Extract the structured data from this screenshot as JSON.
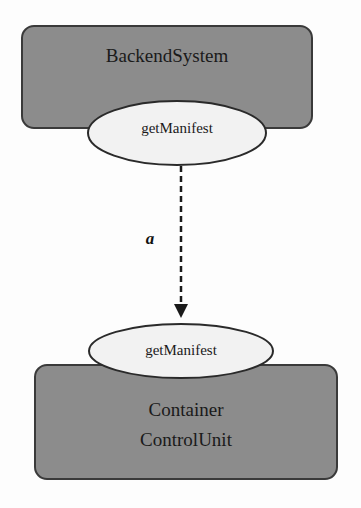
{
  "diagram": {
    "colors": {
      "box_fill": "#8c8c8c",
      "box_stroke": "#3a3a3a",
      "ellipse_fill": "#f2f2f2",
      "ellipse_stroke": "#2a2a2a",
      "edge": "#1a1a1a"
    },
    "nodes": [
      {
        "id": "backend",
        "label": "BackendSystem",
        "shape": "rounded-rect"
      },
      {
        "id": "container",
        "label_line1": "Container",
        "label_line2": "ControlUnit",
        "shape": "rounded-rect"
      }
    ],
    "ports": [
      {
        "id": "backend-port",
        "label": "getManifest",
        "shape": "ellipse",
        "attached_to": "backend"
      },
      {
        "id": "container-port",
        "label": "getManifest",
        "shape": "ellipse",
        "attached_to": "container"
      }
    ],
    "edges": [
      {
        "from": "backend-port",
        "to": "container-port",
        "label": "a",
        "style": "dashed",
        "arrow": "end"
      }
    ]
  }
}
